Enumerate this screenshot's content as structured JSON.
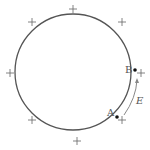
{
  "diagram": {
    "circle": {
      "cx": 73,
      "cy": 72,
      "r": 58,
      "stroke": "#555555"
    },
    "charges": [
      {
        "symbol": "+",
        "x": 77,
        "y": 9
      },
      {
        "symbol": "+",
        "x": 122,
        "y": 22
      },
      {
        "symbol": "+",
        "x": 141,
        "y": 73
      },
      {
        "symbol": "+",
        "x": 122,
        "y": 120
      },
      {
        "symbol": "+",
        "x": 77,
        "y": 141
      },
      {
        "symbol": "+",
        "x": 32,
        "y": 120
      },
      {
        "symbol": "+",
        "x": 10,
        "y": 73
      },
      {
        "symbol": "+",
        "x": 32,
        "y": 22
      }
    ],
    "points": [
      {
        "label": "A",
        "x": 117,
        "y": 117
      },
      {
        "label": "B",
        "x": 135,
        "y": 70
      }
    ],
    "field": {
      "label": "E",
      "color": "#888888"
    }
  }
}
